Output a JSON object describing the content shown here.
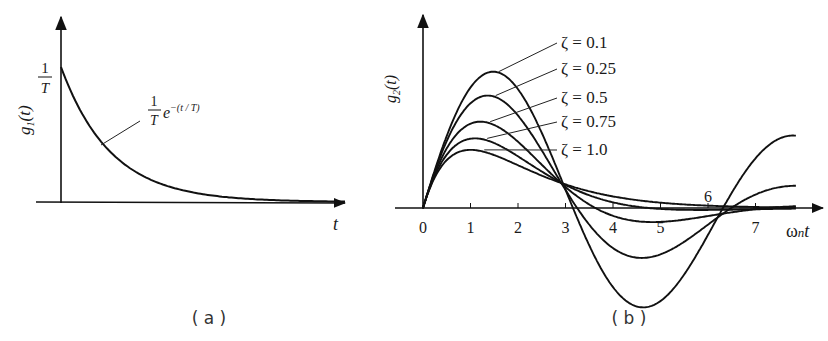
{
  "chart_data": [
    {
      "panel": "a",
      "type": "line",
      "caption": "( a )",
      "title": "",
      "ylabel": "g1(t)",
      "ylabel_main": "g",
      "ylabel_sub": "1",
      "ylabel_arg": "(t)",
      "xlabel": "t",
      "y_tick_label": {
        "num": "1",
        "den": "T"
      },
      "curve_annotation": {
        "num": "1",
        "den": "T",
        "expr": "e",
        "exponent": "−(t / T)"
      },
      "function": "(1/T) e^(-t/T)",
      "x": [
        0,
        0.5,
        1,
        1.5,
        2,
        3,
        4,
        5,
        6
      ],
      "values": [
        1.0,
        0.607,
        0.368,
        0.223,
        0.135,
        0.05,
        0.018,
        0.007,
        0.002
      ],
      "grid": false,
      "legend": null
    },
    {
      "panel": "b",
      "type": "line",
      "caption": "( b )",
      "ylabel": "g2(t)",
      "ylabel_main": "g",
      "ylabel_sub": "2",
      "ylabel_arg": "(t)",
      "xlabel": "ωnt",
      "xlabel_parts": {
        "omega": "ω",
        "sub": "n",
        "t": "t"
      },
      "x_ticks": [
        "0",
        "1",
        "2",
        "3",
        "4",
        "5",
        "6",
        "7"
      ],
      "xlim": [
        0,
        8.5
      ],
      "grid": false,
      "legend_position": "inline annotations, upper middle",
      "series": [
        {
          "name": "ζ = 0.1",
          "zeta": 0.1
        },
        {
          "name": "ζ = 0.25",
          "zeta": 0.25
        },
        {
          "name": "ζ = 0.5",
          "zeta": 0.5
        },
        {
          "name": "ζ = 0.75",
          "zeta": 0.75
        },
        {
          "name": "ζ = 1.0",
          "zeta": 1.0
        }
      ]
    }
  ],
  "captions": {
    "a": "( a )",
    "b": "( b )"
  }
}
